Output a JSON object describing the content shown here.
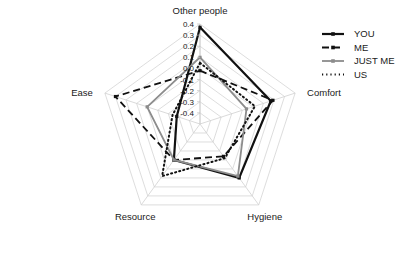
{
  "chart_data": {
    "type": "radar",
    "title": "",
    "categories": [
      "Other people",
      "Comfort",
      "Hygiene",
      "Resource",
      "Ease"
    ],
    "ylim": [
      -0.5,
      0.4
    ],
    "ticks": [
      "0.4",
      "0.3",
      "0.2",
      "0.1",
      "0.0",
      "-0.1",
      "-0.2",
      "-0.3",
      "-0.4"
    ],
    "tick_values": [
      0.4,
      0.3,
      0.2,
      0.1,
      0.0,
      -0.1,
      -0.2,
      -0.3,
      -0.4
    ],
    "grid": true,
    "legend_position": "right",
    "series": [
      {
        "name": "YOU",
        "style": "solid",
        "color": "#111111",
        "width": 2.2,
        "values": [
          0.37,
          0.17,
          0.1,
          -0.1,
          -0.28
        ]
      },
      {
        "name": "ME",
        "style": "dashed",
        "color": "#111111",
        "width": 1.8,
        "values": [
          -0.02,
          0.19,
          -0.14,
          -0.1,
          0.3
        ]
      },
      {
        "name": "JUST ME",
        "style": "solid",
        "color": "#8c8c8c",
        "width": 1.8,
        "values": [
          0.1,
          -0.06,
          0.08,
          -0.1,
          0.0
        ]
      },
      {
        "name": "US",
        "style": "dotted",
        "color": "#111111",
        "width": 2.0,
        "values": [
          0.05,
          0.02,
          -0.12,
          0.08,
          -0.24
        ]
      }
    ]
  },
  "axis_labels": {
    "top": "Other people",
    "right": "Comfort",
    "bottom_right": "Hygiene",
    "bottom_left": "Resource",
    "left": "Ease"
  },
  "legend": {
    "items": [
      {
        "label": "YOU"
      },
      {
        "label": "ME"
      },
      {
        "label": "JUST ME"
      },
      {
        "label": "US"
      }
    ]
  }
}
